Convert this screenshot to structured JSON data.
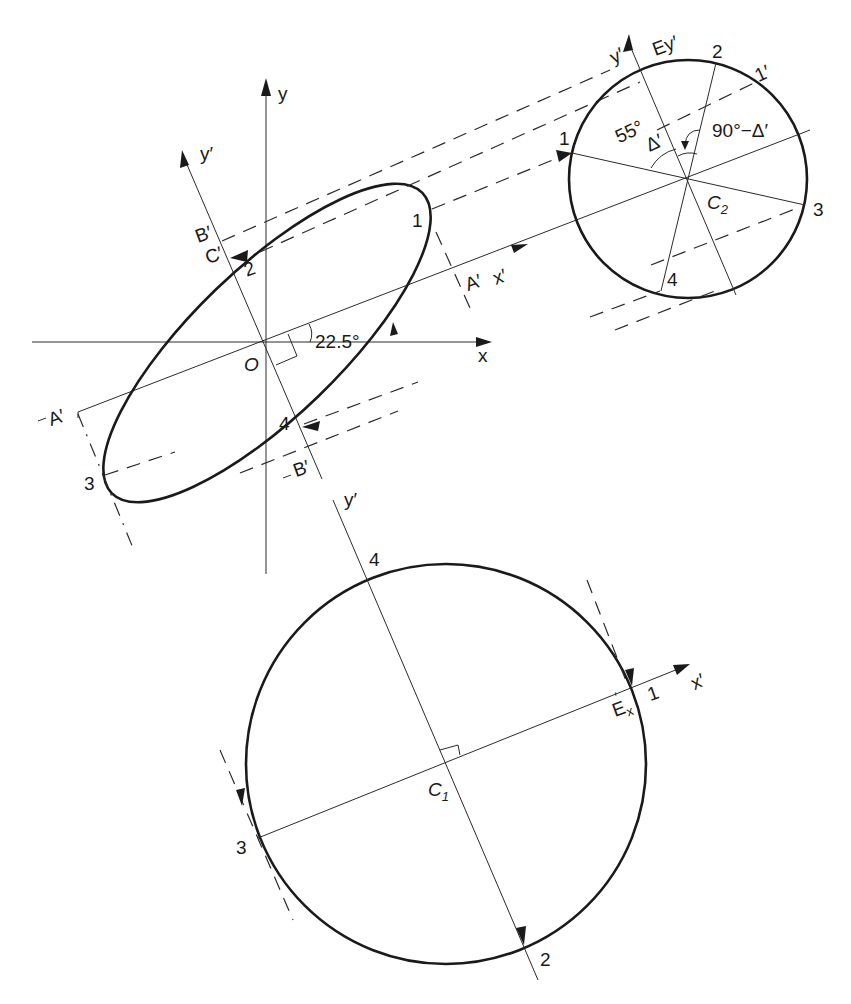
{
  "figure": {
    "colors": {
      "line": "#1a1a1a",
      "background": "#ffffff"
    }
  },
  "ellipse_panel": {
    "axis_x": "x",
    "axis_y": "y",
    "axis_y_prime": "y′",
    "axis_x_prime": "x′",
    "origin": "O",
    "angle": "22.5°",
    "points": [
      "1",
      "2",
      "3",
      "4"
    ],
    "label_B_top": "B′",
    "label_C": "C′",
    "label_A_right": "A′",
    "label_A_left": "A′",
    "label_B_bottom": "B′"
  },
  "circle_c2": {
    "center": "C",
    "center_sub": "2",
    "axis_y_prime": "y′",
    "axis_Ey": "Ey′",
    "points": [
      "1",
      "2",
      "3",
      "4"
    ],
    "point_1_prime": "1′",
    "angle_55": "55°",
    "angle_delta": "Δ′",
    "angle_complement": "90°−Δ′"
  },
  "circle_c1": {
    "center": "C",
    "center_sub": "1",
    "axis_y_prime": "y′",
    "axis_x_prime": "x′",
    "label_Ex": "E",
    "label_Ex_sub": "x",
    "label_Ex_sup": "′",
    "points": [
      "1",
      "2",
      "3",
      "4"
    ]
  }
}
